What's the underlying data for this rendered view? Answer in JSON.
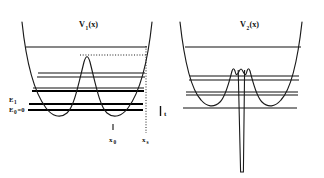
{
  "figure": {
    "type": "physics-potential-diagram",
    "background_color": "#ffffff",
    "ink_color": "#111111"
  },
  "panels": [
    {
      "id": "left",
      "title": "V",
      "title_subscript": "1",
      "title_argument": "(x)",
      "potential": {
        "shape": "symmetric double well inside confining parabola with smooth central barrier",
        "barrier_peak_y": 55,
        "well_minimum_y": 110
      },
      "energy_levels": [
        {
          "name": "E0",
          "label": "E",
          "label_subscript": "0",
          "label_suffix": "=0",
          "y": 110,
          "weight": "thick",
          "labeled": true
        },
        {
          "name": "E1",
          "label": "E",
          "label_subscript": "1",
          "label_suffix": "",
          "y": 104,
          "weight": "thick",
          "labeled": true
        },
        {
          "name": "E2",
          "label": "",
          "label_subscript": "",
          "label_suffix": "",
          "y": 91,
          "weight": "thick",
          "labeled": false
        },
        {
          "name": "E3",
          "label": "",
          "label_subscript": "",
          "label_suffix": "",
          "y": 88,
          "weight": "thin",
          "labeled": false
        },
        {
          "name": "E4",
          "label": "",
          "label_subscript": "",
          "label_suffix": "",
          "y": 77,
          "weight": "thin",
          "labeled": false
        },
        {
          "name": "E5",
          "label": "",
          "label_subscript": "",
          "label_suffix": "",
          "y": 73,
          "weight": "thin",
          "labeled": false
        },
        {
          "name": "E6",
          "label": "",
          "label_subscript": "",
          "label_suffix": "",
          "y": 47,
          "weight": "thin",
          "labeled": false
        }
      ],
      "axis_marks": [
        {
          "name": "x0",
          "label": "x",
          "label_subscript": "0",
          "x": 113,
          "tick": true
        },
        {
          "name": "xs",
          "label": "x",
          "label_subscript": "s",
          "x": 146,
          "tick": false
        }
      ],
      "guides": [
        {
          "name": "barrier-top-dotted-horizontal",
          "orientation": "horizontal"
        },
        {
          "name": "xs-dotted-vertical",
          "orientation": "vertical"
        }
      ]
    },
    {
      "id": "right",
      "title": "V",
      "title_subscript": "2",
      "title_argument": "(x)",
      "potential": {
        "shape": "double well inside confining parabola with narrow deep delta-like spike at center",
        "barrier_peak_y": 69,
        "well_minimum_y": 102,
        "spike_bottom_y": 172
      },
      "energy_levels": [
        {
          "name": "E0",
          "label": "",
          "label_subscript": "",
          "label_suffix": "",
          "y": 108,
          "weight": "thin",
          "labeled": false
        },
        {
          "name": "E1",
          "label": "",
          "label_subscript": "",
          "label_suffix": "",
          "y": 95,
          "weight": "thin",
          "labeled": false
        },
        {
          "name": "E2",
          "label": "",
          "label_subscript": "",
          "label_suffix": "",
          "y": 92,
          "weight": "thin",
          "labeled": false
        },
        {
          "name": "E3",
          "label": "",
          "label_subscript": "",
          "label_suffix": "",
          "y": 80,
          "weight": "thin",
          "labeled": false
        },
        {
          "name": "E4",
          "label": "",
          "label_subscript": "",
          "label_suffix": "",
          "y": 76,
          "weight": "thin",
          "labeled": false
        },
        {
          "name": "E5",
          "label": "",
          "label_subscript": "",
          "label_suffix": "",
          "y": 47,
          "weight": "thin",
          "labeled": false
        }
      ],
      "axis_marks": [],
      "guides": []
    }
  ],
  "separator": {
    "name": "between-panels-mark",
    "label": "t",
    "bar": "|"
  }
}
